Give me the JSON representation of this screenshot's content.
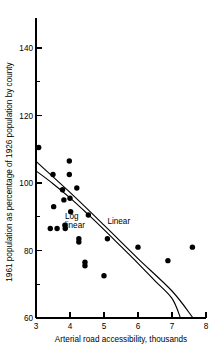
{
  "chart_data": {
    "type": "scatter",
    "title": "",
    "xlabel": "Arterial road accessibility, thousands",
    "ylabel": "1961 population as percentage of 1926 population by county",
    "xlim": [
      3,
      8
    ],
    "ylim": [
      60,
      150
    ],
    "xticks": [
      3,
      4,
      5,
      6,
      7,
      8
    ],
    "xticklabels": [
      "3",
      "4",
      "5",
      "6",
      "7",
      "8"
    ],
    "yticks": [
      60,
      70,
      80,
      90,
      100,
      110,
      120,
      130,
      140,
      150
    ],
    "yticklabels_major": [
      "60",
      "80",
      "100",
      "120",
      "140"
    ],
    "ymajorticks": [
      60,
      80,
      100,
      120,
      140
    ],
    "yminorticks": [
      70,
      90,
      110,
      130,
      150
    ],
    "grid": false,
    "legend_position": "inline-annotations",
    "points": [
      {
        "x": 3.08,
        "y": 110.5
      },
      {
        "x": 3.5,
        "y": 102.5
      },
      {
        "x": 3.52,
        "y": 93.0
      },
      {
        "x": 3.42,
        "y": 86.5
      },
      {
        "x": 3.62,
        "y": 86.5
      },
      {
        "x": 3.78,
        "y": 98.0
      },
      {
        "x": 3.82,
        "y": 95.0
      },
      {
        "x": 3.85,
        "y": 87.5
      },
      {
        "x": 3.86,
        "y": 86.5
      },
      {
        "x": 3.98,
        "y": 106.5
      },
      {
        "x": 3.98,
        "y": 102.5
      },
      {
        "x": 4.0,
        "y": 95.5
      },
      {
        "x": 4.02,
        "y": 91.5
      },
      {
        "x": 4.2,
        "y": 98.5
      },
      {
        "x": 4.26,
        "y": 83.5
      },
      {
        "x": 4.26,
        "y": 82.5
      },
      {
        "x": 4.44,
        "y": 76.5
      },
      {
        "x": 4.44,
        "y": 75.5
      },
      {
        "x": 4.54,
        "y": 90.5
      },
      {
        "x": 5.0,
        "y": 72.5
      },
      {
        "x": 5.1,
        "y": 83.5
      },
      {
        "x": 6.0,
        "y": 81.0
      },
      {
        "x": 6.88,
        "y": 77.0
      },
      {
        "x": 7.6,
        "y": 81.0
      }
    ],
    "series": [
      {
        "name": "Linear",
        "type": "line",
        "label": "Linear",
        "label_at": {
          "x": 5.1,
          "y": 87.8
        },
        "points": [
          {
            "x": 3.0,
            "y": 106.4
          },
          {
            "x": 4.0,
            "y": 97.2
          },
          {
            "x": 5.0,
            "y": 87.5
          },
          {
            "x": 6.0,
            "y": 77.6
          },
          {
            "x": 7.0,
            "y": 68.0
          },
          {
            "x": 7.62,
            "y": 60.0
          }
        ]
      },
      {
        "name": "Log linear",
        "type": "curve",
        "label_line1": "Log",
        "label_line2": "linear",
        "label_at": {
          "x": 3.85,
          "y": 89.4
        },
        "points": [
          {
            "x": 3.0,
            "y": 103.6
          },
          {
            "x": 3.5,
            "y": 99.8
          },
          {
            "x": 4.0,
            "y": 95.6
          },
          {
            "x": 4.5,
            "y": 91.0
          },
          {
            "x": 5.0,
            "y": 86.2
          },
          {
            "x": 5.5,
            "y": 81.2
          },
          {
            "x": 6.0,
            "y": 76.2
          },
          {
            "x": 6.5,
            "y": 71.0
          },
          {
            "x": 7.0,
            "y": 65.8
          },
          {
            "x": 7.25,
            "y": 60.0
          }
        ]
      }
    ]
  }
}
